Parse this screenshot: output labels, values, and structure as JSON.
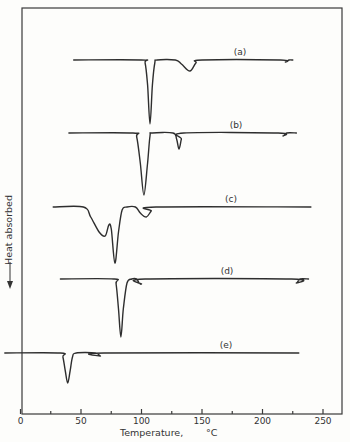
{
  "chart_data": {
    "type": "line",
    "title": "",
    "xlabel": "Temperature,",
    "xlabel_unit": "°C",
    "ylabel": "Heat absorbed",
    "ylabel_arrow": "down",
    "xlim": [
      0,
      265
    ],
    "xticks_major": [
      0,
      50,
      100,
      150,
      200,
      250
    ],
    "xticks_minor": [
      25,
      75,
      125,
      175,
      225
    ],
    "xtick_labels": [
      "0",
      "50",
      "100",
      "150",
      "200",
      "250"
    ],
    "grid": false,
    "legend": "none; curves labeled inline (a)–(e)",
    "series": [
      {
        "name": "(a)",
        "t_range": [
          44,
          225
        ],
        "peaks": [
          {
            "temp": 107,
            "depth": "large"
          },
          {
            "temp": 140,
            "depth": "small"
          },
          {
            "temp": 219,
            "depth": "very small"
          }
        ],
        "points": [
          [
            44,
            0
          ],
          [
            100,
            0
          ],
          [
            103,
            -3
          ],
          [
            105,
            -25
          ],
          [
            107,
            -64
          ],
          [
            109,
            -25
          ],
          [
            111,
            -3
          ],
          [
            113,
            0
          ],
          [
            128,
            0
          ],
          [
            133,
            -4
          ],
          [
            140,
            -11
          ],
          [
            145,
            -3
          ],
          [
            150,
            0
          ],
          [
            215,
            0
          ],
          [
            219,
            -2
          ],
          [
            222,
            0
          ],
          [
            225,
            0
          ]
        ]
      },
      {
        "name": "(b)",
        "t_range": [
          40,
          228
        ],
        "peaks": [
          {
            "temp": 102,
            "depth": "large"
          },
          {
            "temp": 131,
            "depth": "small"
          },
          {
            "temp": 217,
            "depth": "very small"
          }
        ],
        "points": [
          [
            40,
            0
          ],
          [
            93,
            0
          ],
          [
            96,
            -4
          ],
          [
            99,
            -30
          ],
          [
            102,
            -62
          ],
          [
            105,
            -30
          ],
          [
            107,
            -3
          ],
          [
            109,
            0
          ],
          [
            126,
            0
          ],
          [
            129,
            -6
          ],
          [
            131,
            -16
          ],
          [
            133,
            -6
          ],
          [
            135,
            0
          ],
          [
            213,
            0
          ],
          [
            217,
            -3
          ],
          [
            220,
            0
          ],
          [
            228,
            0
          ]
        ]
      },
      {
        "name": "(c)",
        "t_range": [
          27,
          240
        ],
        "peaks": [
          {
            "temp": 71,
            "depth": "medium"
          },
          {
            "temp": 78,
            "depth": "large"
          },
          {
            "temp": 104,
            "depth": "small"
          }
        ],
        "points": [
          [
            27,
            0
          ],
          [
            52,
            0
          ],
          [
            58,
            -10
          ],
          [
            65,
            -25
          ],
          [
            70,
            -29
          ],
          [
            73,
            -18
          ],
          [
            75,
            -22
          ],
          [
            78,
            -56
          ],
          [
            81,
            -25
          ],
          [
            84,
            -3
          ],
          [
            88,
            0
          ],
          [
            95,
            0
          ],
          [
            99,
            -6
          ],
          [
            104,
            -10
          ],
          [
            108,
            -4
          ],
          [
            112,
            0
          ],
          [
            240,
            0
          ]
        ]
      },
      {
        "name": "(d)",
        "t_range": [
          33,
          238
        ],
        "peaks": [
          {
            "temp": 83,
            "depth": "large"
          },
          {
            "temp": 100,
            "depth": "small"
          },
          {
            "temp": 228,
            "depth": "very small"
          }
        ],
        "points": [
          [
            33,
            0
          ],
          [
            77,
            0
          ],
          [
            79,
            -5
          ],
          [
            81,
            -30
          ],
          [
            83,
            -58
          ],
          [
            85,
            -30
          ],
          [
            88,
            -4
          ],
          [
            92,
            0
          ],
          [
            96,
            0
          ],
          [
            98,
            -4
          ],
          [
            100,
            -5
          ],
          [
            103,
            0
          ],
          [
            224,
            0
          ],
          [
            228,
            -4
          ],
          [
            231,
            0
          ],
          [
            238,
            0
          ]
        ]
      },
      {
        "name": "(e)",
        "t_range": [
          -13,
          230
        ],
        "peaks": [
          {
            "temp": 39,
            "depth": "large"
          },
          {
            "temp": 66,
            "depth": "very small"
          }
        ],
        "points": [
          [
            -13,
            0
          ],
          [
            33,
            0
          ],
          [
            35,
            -4
          ],
          [
            37,
            -18
          ],
          [
            39,
            -30
          ],
          [
            41,
            -18
          ],
          [
            43,
            -4
          ],
          [
            46,
            0
          ],
          [
            62,
            0
          ],
          [
            66,
            -3
          ],
          [
            69,
            0
          ],
          [
            230,
            0
          ]
        ]
      }
    ]
  },
  "labels": {
    "xlabel": "Temperature,",
    "xunit": "°C",
    "ylabel": "Heat absorbed",
    "curves": [
      "(a)",
      "(b)",
      "(c)",
      "(d)",
      "(e)"
    ]
  }
}
